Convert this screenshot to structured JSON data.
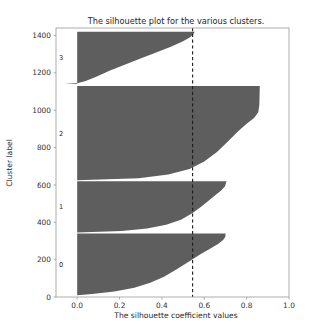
{
  "figure": {
    "title": "The silhouette plot for the various clusters.",
    "xlabel": "The silhouette coefficient values",
    "ylabel": "Cluster label",
    "fill_color": "#5e5e5e",
    "avg_line_color": "#1a1a1a"
  },
  "axes": {
    "x_ticks": [
      "0.0",
      "0.2",
      "0.4",
      "0.6",
      "0.8",
      "1.0"
    ],
    "y_ticks": [
      "0",
      "200",
      "400",
      "600",
      "800",
      "1000",
      "1200",
      "1400"
    ],
    "cluster_labels": [
      "0",
      "1",
      "2",
      "3"
    ]
  },
  "chart_data": {
    "type": "area",
    "title": "The silhouette plot for the various clusters.",
    "xlabel": "The silhouette coefficient values",
    "ylabel": "Cluster label",
    "xlim": [
      -0.1,
      1.0
    ],
    "ylim": [
      0,
      1440
    ],
    "x_ticks": [
      0.0,
      0.2,
      0.4,
      0.6,
      0.8,
      1.0
    ],
    "y_ticks": [
      0,
      200,
      400,
      600,
      800,
      1000,
      1200,
      1400
    ],
    "grid": false,
    "legend": false,
    "average_silhouette_score": 0.545,
    "n_clusters": 4,
    "clusters": [
      {
        "label": "0",
        "y_start": 10,
        "y_end": 340,
        "size": 330,
        "max_silhouette": 0.7,
        "min_silhouette": 0.0,
        "profile": [
          [
            0.0,
            0.0
          ],
          [
            0.02,
            0.07
          ],
          [
            0.06,
            0.175
          ],
          [
            0.12,
            0.27
          ],
          [
            0.2,
            0.345
          ],
          [
            0.3,
            0.41
          ],
          [
            0.42,
            0.47
          ],
          [
            0.55,
            0.53
          ],
          [
            0.66,
            0.58
          ],
          [
            0.75,
            0.625
          ],
          [
            0.83,
            0.665
          ],
          [
            0.9,
            0.69
          ],
          [
            0.95,
            0.7
          ],
          [
            1.0,
            0.7
          ]
        ]
      },
      {
        "label": "1",
        "y_start": 345,
        "y_end": 620,
        "size": 275,
        "max_silhouette": 0.705,
        "min_silhouette": 0.0,
        "profile": [
          [
            0.0,
            0.0
          ],
          [
            0.03,
            0.21
          ],
          [
            0.08,
            0.33
          ],
          [
            0.15,
            0.42
          ],
          [
            0.25,
            0.49
          ],
          [
            0.38,
            0.545
          ],
          [
            0.5,
            0.585
          ],
          [
            0.62,
            0.62
          ],
          [
            0.72,
            0.65
          ],
          [
            0.82,
            0.68
          ],
          [
            0.9,
            0.698
          ],
          [
            1.0,
            0.705
          ]
        ]
      },
      {
        "label": "2",
        "y_start": 625,
        "y_end": 1130,
        "size": 505,
        "max_silhouette": 0.862,
        "min_silhouette": 0.0,
        "profile": [
          [
            0.0,
            0.0
          ],
          [
            0.02,
            0.29
          ],
          [
            0.06,
            0.43
          ],
          [
            0.12,
            0.53
          ],
          [
            0.2,
            0.6
          ],
          [
            0.3,
            0.66
          ],
          [
            0.42,
            0.715
          ],
          [
            0.52,
            0.76
          ],
          [
            0.6,
            0.8
          ],
          [
            0.66,
            0.835
          ],
          [
            0.72,
            0.855
          ],
          [
            0.8,
            0.86
          ],
          [
            1.0,
            0.862
          ]
        ]
      },
      {
        "label": "3",
        "y_start": 1140,
        "y_end": 1420,
        "size": 280,
        "max_silhouette": 0.555,
        "min_silhouette": -0.06,
        "profile": [
          [
            0.0,
            -0.06
          ],
          [
            0.02,
            0.005
          ],
          [
            0.06,
            0.04
          ],
          [
            0.14,
            0.09
          ],
          [
            0.26,
            0.155
          ],
          [
            0.38,
            0.23
          ],
          [
            0.5,
            0.305
          ],
          [
            0.62,
            0.385
          ],
          [
            0.72,
            0.445
          ],
          [
            0.82,
            0.5
          ],
          [
            0.9,
            0.535
          ],
          [
            0.96,
            0.55
          ],
          [
            1.0,
            0.555
          ]
        ]
      }
    ]
  }
}
